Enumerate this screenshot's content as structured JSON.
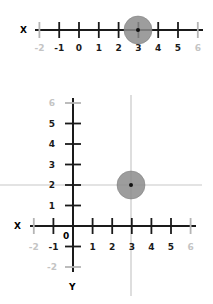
{
  "colors": {
    "axis": "#1a1a1a",
    "faded_tick": "#b5b5b5",
    "faded_label": "#c4c4c4",
    "guide_line": "#c8c8c8",
    "point_fill": "#8c8c8c",
    "point_stroke": "#7a7a7a",
    "point_dot": "#111111"
  },
  "number_line": {
    "axis_label": "X",
    "ticks": [
      "-2",
      "-1",
      "0",
      "1",
      "2",
      "3",
      "4",
      "5",
      "6"
    ],
    "faded_ticks": [
      "-2",
      "6"
    ],
    "point": {
      "x": 3
    }
  },
  "coordinate_plane": {
    "x_axis_label": "X",
    "y_axis_label": "Y",
    "origin_label": "0",
    "x_ticks": [
      "-2",
      "-1",
      "1",
      "2",
      "3",
      "4",
      "5",
      "6"
    ],
    "y_ticks": [
      "6",
      "5",
      "4",
      "3",
      "2",
      "1",
      "-1",
      "-2"
    ],
    "faded_ticks": [
      "-2",
      "6"
    ],
    "point": {
      "x": 3,
      "y": 2
    }
  },
  "chart_data": [
    {
      "type": "scatter",
      "title": "",
      "xlabel": "X",
      "ylabel": "",
      "xlim": [
        -2,
        6
      ],
      "x_tick_labels": [
        "-2",
        "-1",
        "0",
        "1",
        "2",
        "3",
        "4",
        "5",
        "6"
      ],
      "points": [
        {
          "x": 3
        }
      ]
    },
    {
      "type": "scatter",
      "title": "",
      "xlabel": "X",
      "ylabel": "Y",
      "xlim": [
        -2,
        6
      ],
      "ylim": [
        -2,
        6
      ],
      "x_tick_labels": [
        "-2",
        "-1",
        "0",
        "1",
        "2",
        "3",
        "4",
        "5",
        "6"
      ],
      "y_tick_labels": [
        "-2",
        "-1",
        "1",
        "2",
        "3",
        "4",
        "5",
        "6"
      ],
      "points": [
        {
          "x": 3,
          "y": 2
        }
      ],
      "guide_lines": {
        "vertical_x": 3,
        "horizontal_y": 2
      }
    }
  ]
}
